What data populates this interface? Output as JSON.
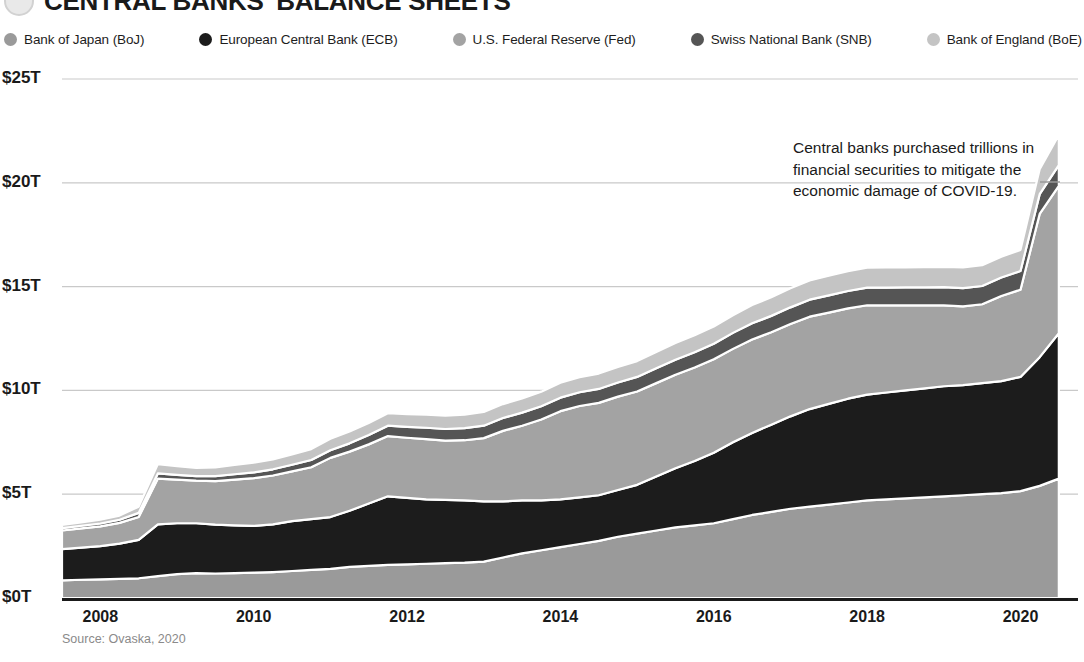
{
  "header": {
    "title": "CENTRAL BANKS' BALANCE SHEETS",
    "logo_name": "visual-capitalist-logo"
  },
  "legend": {
    "items": [
      {
        "label": "Bank of Japan (BoJ)",
        "color": "#9a9a9a"
      },
      {
        "label": "European Central Bank (ECB)",
        "color": "#1c1c1c"
      },
      {
        "label": "U.S. Federal Reserve (Fed)",
        "color": "#a3a3a3"
      },
      {
        "label": "Swiss National Bank (SNB)",
        "color": "#555555"
      },
      {
        "label": "Bank of England (BoE)",
        "color": "#c4c4c4"
      }
    ]
  },
  "annotation": {
    "text": "Central banks purchased trillions in financial securities to mitigate the economic damage of COVID-19."
  },
  "source": {
    "text": "Source: Ovaska, 2020"
  },
  "chart_data": {
    "type": "area",
    "stacked": true,
    "title": "CENTRAL BANKS' BALANCE SHEETS",
    "xlabel": "",
    "ylabel": "",
    "ylim": [
      0,
      25
    ],
    "xlim": [
      2007.5,
      2020.75
    ],
    "grid": true,
    "legend_position": "top",
    "ytick_labels": [
      "$0T",
      "$5T",
      "$10T",
      "$15T",
      "$20T",
      "$25T"
    ],
    "ytick_values": [
      0,
      5,
      10,
      15,
      20,
      25
    ],
    "xtick_labels": [
      "2008",
      "2010",
      "2012",
      "2014",
      "2016",
      "2018",
      "2020"
    ],
    "xtick_values": [
      2008,
      2010,
      2012,
      2014,
      2016,
      2018,
      2020
    ],
    "units": "trillions of USD",
    "x": [
      2007.5,
      2007.75,
      2008.0,
      2008.25,
      2008.5,
      2008.75,
      2009.0,
      2009.25,
      2009.5,
      2009.75,
      2010.0,
      2010.25,
      2010.5,
      2010.75,
      2011.0,
      2011.25,
      2011.5,
      2011.75,
      2012.0,
      2012.25,
      2012.5,
      2012.75,
      2013.0,
      2013.25,
      2013.5,
      2013.75,
      2014.0,
      2014.25,
      2014.5,
      2014.75,
      2015.0,
      2015.25,
      2015.5,
      2015.75,
      2016.0,
      2016.25,
      2016.5,
      2016.75,
      2017.0,
      2017.25,
      2017.5,
      2017.75,
      2018.0,
      2018.25,
      2018.5,
      2018.75,
      2019.0,
      2019.25,
      2019.5,
      2019.75,
      2020.0,
      2020.25,
      2020.5
    ],
    "series": [
      {
        "name": "Bank of Japan (BoJ)",
        "color": "#9a9a9a",
        "values": [
          0.85,
          0.88,
          0.9,
          0.92,
          0.95,
          1.05,
          1.15,
          1.2,
          1.18,
          1.2,
          1.22,
          1.25,
          1.3,
          1.35,
          1.4,
          1.5,
          1.55,
          1.6,
          1.62,
          1.65,
          1.68,
          1.7,
          1.75,
          1.95,
          2.15,
          2.3,
          2.45,
          2.6,
          2.75,
          2.95,
          3.1,
          3.25,
          3.4,
          3.5,
          3.6,
          3.8,
          4.0,
          4.15,
          4.3,
          4.4,
          4.5,
          4.6,
          4.7,
          4.75,
          4.8,
          4.85,
          4.9,
          4.95,
          5.0,
          5.05,
          5.15,
          5.4,
          5.75
        ]
      },
      {
        "name": "European Central Bank (ECB)",
        "color": "#1c1c1c",
        "values": [
          1.5,
          1.55,
          1.6,
          1.7,
          1.85,
          2.5,
          2.45,
          2.4,
          2.35,
          2.3,
          2.25,
          2.3,
          2.4,
          2.45,
          2.5,
          2.7,
          3.0,
          3.3,
          3.2,
          3.1,
          3.05,
          3.0,
          2.9,
          2.7,
          2.55,
          2.4,
          2.3,
          2.25,
          2.2,
          2.25,
          2.35,
          2.6,
          2.85,
          3.1,
          3.4,
          3.7,
          3.95,
          4.2,
          4.45,
          4.7,
          4.85,
          5.0,
          5.1,
          5.15,
          5.2,
          5.25,
          5.3,
          5.3,
          5.35,
          5.4,
          5.5,
          6.2,
          7.0
        ]
      },
      {
        "name": "U.S. Federal Reserve (Fed)",
        "color": "#a3a3a3",
        "values": [
          0.9,
          0.92,
          0.95,
          1.0,
          1.1,
          2.2,
          2.1,
          2.05,
          2.1,
          2.2,
          2.3,
          2.35,
          2.4,
          2.5,
          2.85,
          2.85,
          2.85,
          2.9,
          2.9,
          2.9,
          2.85,
          2.9,
          3.05,
          3.4,
          3.6,
          3.9,
          4.25,
          4.4,
          4.45,
          4.5,
          4.5,
          4.5,
          4.5,
          4.5,
          4.5,
          4.5,
          4.5,
          4.45,
          4.45,
          4.45,
          4.4,
          4.35,
          4.3,
          4.2,
          4.1,
          4.0,
          3.9,
          3.8,
          3.8,
          4.1,
          4.2,
          6.9,
          7.1
        ]
      },
      {
        "name": "Swiss National Bank (SNB)",
        "color": "#555555",
        "values": [
          0.12,
          0.13,
          0.14,
          0.15,
          0.2,
          0.25,
          0.23,
          0.22,
          0.24,
          0.26,
          0.28,
          0.3,
          0.32,
          0.35,
          0.37,
          0.4,
          0.45,
          0.5,
          0.52,
          0.55,
          0.56,
          0.58,
          0.6,
          0.62,
          0.63,
          0.64,
          0.65,
          0.66,
          0.67,
          0.68,
          0.7,
          0.72,
          0.73,
          0.74,
          0.75,
          0.77,
          0.78,
          0.79,
          0.8,
          0.82,
          0.83,
          0.84,
          0.85,
          0.85,
          0.86,
          0.86,
          0.87,
          0.88,
          0.88,
          0.89,
          0.9,
          0.95,
          1.0
        ]
      },
      {
        "name": "Bank of England (BoE)",
        "color": "#c4c4c4",
        "values": [
          0.15,
          0.16,
          0.18,
          0.2,
          0.3,
          0.45,
          0.42,
          0.4,
          0.42,
          0.45,
          0.47,
          0.48,
          0.5,
          0.52,
          0.55,
          0.57,
          0.58,
          0.6,
          0.62,
          0.63,
          0.64,
          0.65,
          0.66,
          0.67,
          0.68,
          0.7,
          0.72,
          0.73,
          0.74,
          0.75,
          0.76,
          0.78,
          0.8,
          0.82,
          0.83,
          0.85,
          0.88,
          0.9,
          0.92,
          0.93,
          0.94,
          0.95,
          0.96,
          0.97,
          0.97,
          0.98,
          0.98,
          0.99,
          1.0,
          1.0,
          1.02,
          1.2,
          1.45
        ]
      }
    ]
  }
}
